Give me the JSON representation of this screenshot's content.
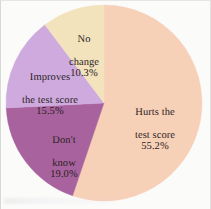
{
  "chart_data": {
    "type": "pie",
    "title": "",
    "subtitle": "",
    "xlabel": "",
    "ylabel": "",
    "legend_position": "none",
    "labels_inside_slices": true,
    "start_angle_deg": 0,
    "direction": "clockwise",
    "categories": [
      "Hurts the test score",
      "Don't know",
      "Improves the test score",
      "No change"
    ],
    "values": [
      55.2,
      19.0,
      15.5,
      10.3
    ],
    "value_suffix": "%",
    "colors": [
      "#f7d0b8",
      "#a8639f",
      "#ceaade",
      "#f2e3bd"
    ],
    "slices": [
      {
        "name": "hurts",
        "label": "Hurts the\ntest score",
        "label_line1": "Hurts the",
        "label_line2": "test score",
        "value": 55.2,
        "value_text": "55.2%",
        "color": "#f7d0b8",
        "start_deg": 0.0,
        "end_deg": 198.7
      },
      {
        "name": "dont-know",
        "label": "Don't\nknow",
        "label_line1": "Don't",
        "label_line2": "know",
        "value": 19.0,
        "value_text": "19.0%",
        "color": "#a8639f",
        "start_deg": 198.7,
        "end_deg": 267.1
      },
      {
        "name": "improves",
        "label": "Improves\nthe test score",
        "label_line1": "Improves",
        "label_line2": "the test score",
        "value": 15.5,
        "value_text": "15.5%",
        "color": "#ceaade",
        "start_deg": 267.1,
        "end_deg": 322.9
      },
      {
        "name": "no-change",
        "label": "No\nchange",
        "label_line1": "No",
        "label_line2": "change",
        "value": 10.3,
        "value_text": "10.3%",
        "color": "#f2e3bd",
        "start_deg": 322.9,
        "end_deg": 360.0
      }
    ],
    "geometry": {
      "center_x": 104,
      "center_y": 103,
      "radius": 98
    },
    "background_color": "#fbfbfa",
    "text_color": "#2a211c"
  }
}
